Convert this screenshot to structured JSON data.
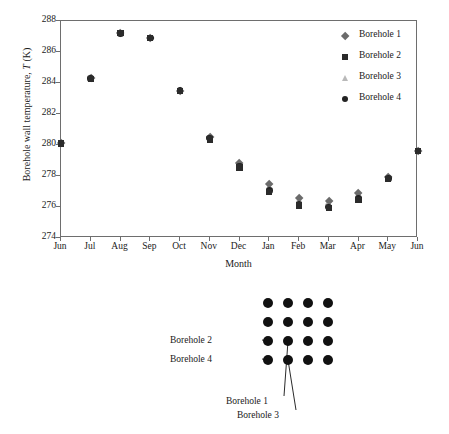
{
  "chart_data": {
    "type": "scatter",
    "title": "",
    "xlabel": "Month",
    "ylabel": "Borehole wall temperature, T (K)",
    "ylabel_prefix": "Borehole wall temperature, ",
    "ylabel_italic": "T",
    "ylabel_suffix": " (K)",
    "categories": [
      "Jun",
      "Jul",
      "Aug",
      "Sep",
      "Oct",
      "Nov",
      "Dec",
      "Jan",
      "Feb",
      "Mar",
      "Apr",
      "May",
      "Jun"
    ],
    "ylim": [
      274,
      288
    ],
    "yticks": [
      274,
      276,
      278,
      280,
      282,
      284,
      286,
      288
    ],
    "grid": false,
    "legend_position": "top-right",
    "series": [
      {
        "name": "Borehole 1",
        "marker": "diamond",
        "color": "#6b6b6b",
        "values": [
          280.1,
          284.3,
          287.2,
          286.9,
          283.5,
          280.5,
          278.8,
          277.5,
          276.6,
          276.4,
          276.9,
          277.9,
          279.6
        ]
      },
      {
        "name": "Borehole 2",
        "marker": "square",
        "color": "#2b2b2b",
        "values": [
          280.1,
          284.25,
          287.2,
          286.9,
          283.5,
          280.35,
          278.55,
          276.95,
          276.1,
          275.95,
          276.45,
          277.8,
          279.6
        ]
      },
      {
        "name": "Borehole 3",
        "marker": "triangle",
        "color": "#b9b9b9",
        "values": [
          280.1,
          284.35,
          287.2,
          286.95,
          283.5,
          280.5,
          278.75,
          277.35,
          276.5,
          276.3,
          276.8,
          277.9,
          279.6
        ]
      },
      {
        "name": "Borehole 4",
        "marker": "circle",
        "color": "#232323",
        "values": [
          280.1,
          284.3,
          287.2,
          286.9,
          283.5,
          280.45,
          278.65,
          277.05,
          276.2,
          276.0,
          276.55,
          277.85,
          279.6
        ]
      }
    ]
  },
  "legend": {
    "items": [
      {
        "label": "Borehole 1",
        "marker": "diamond"
      },
      {
        "label": "Borehole 2",
        "marker": "square"
      },
      {
        "label": "Borehole 3",
        "marker": "triangle"
      },
      {
        "label": "Borehole 4",
        "marker": "circle"
      }
    ]
  },
  "diagram": {
    "grid": {
      "rows": 4,
      "columns": 4,
      "dot_color": "#111111"
    },
    "callouts": [
      {
        "label": "Borehole 2",
        "target_row": 3,
        "target_col": 1
      },
      {
        "label": "Borehole 4",
        "target_row": 4,
        "target_col": 1
      },
      {
        "label": "Borehole 1",
        "target_row": 3,
        "target_col": 2
      },
      {
        "label": "Borehole 3",
        "target_row": 4,
        "target_col": 2
      }
    ]
  }
}
